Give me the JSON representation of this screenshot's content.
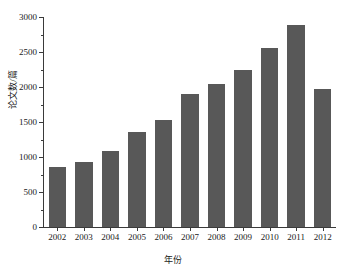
{
  "chart_data": {
    "type": "bar",
    "title": "",
    "xlabel": "年份",
    "ylabel": "论文数/篇",
    "categories": [
      "2002",
      "2003",
      "2004",
      "2005",
      "2006",
      "2007",
      "2008",
      "2009",
      "2010",
      "2011",
      "2012"
    ],
    "values": [
      860,
      930,
      1090,
      1355,
      1535,
      1900,
      2040,
      2240,
      2560,
      2880,
      1975
    ],
    "ylim": [
      0,
      3000
    ],
    "ytick_labels": [
      "0",
      "500",
      "1000",
      "1500",
      "2000",
      "2500",
      "3000"
    ],
    "ytick_values": [
      0,
      500,
      1000,
      1500,
      2000,
      2500,
      3000
    ],
    "yminor_values": [
      250,
      750,
      1250,
      1750,
      2250,
      2750
    ],
    "grid": false,
    "legend": null,
    "bar_color": "#585858",
    "axis_color": "#3a3a3a",
    "background_color": "#ffffff",
    "series": [
      {
        "name": "论文数",
        "values": [
          860,
          930,
          1090,
          1355,
          1535,
          1900,
          2040,
          2240,
          2560,
          2880,
          1975
        ]
      }
    ]
  }
}
